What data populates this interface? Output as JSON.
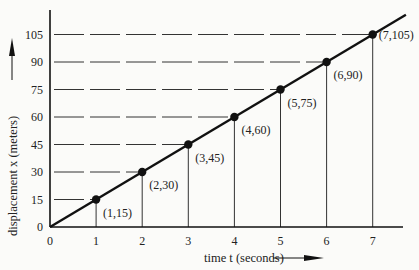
{
  "chart_data": {
    "type": "line",
    "title": "",
    "xlabel": "time t (seconds)",
    "ylabel": "displacement x (meters)",
    "x": [
      1,
      2,
      3,
      4,
      5,
      6,
      7
    ],
    "series": [
      {
        "name": "displacement",
        "values": [
          15,
          30,
          45,
          60,
          75,
          90,
          105
        ]
      }
    ],
    "point_labels": [
      "(1,15)",
      "(2,30)",
      "(3,45)",
      "(4,60)",
      "(5,75)",
      "(6,90)",
      "(7,105)"
    ],
    "x_ticks": [
      "0",
      "1",
      "2",
      "3",
      "4",
      "5",
      "6",
      "7"
    ],
    "y_ticks": [
      "0",
      "15",
      "30",
      "45",
      "60",
      "75",
      "90",
      "105"
    ],
    "xlim": [
      0,
      7.8
    ],
    "ylim": [
      0,
      118
    ],
    "grid": "dashed horizontal guides and solid vertical drop lines at each data point",
    "legend": "none",
    "colors": {
      "line": "#111111",
      "points": "#111111",
      "guides": "#333333",
      "background": "#fbfbf9"
    }
  },
  "labels": {
    "xlabel": "time t (seconds)",
    "ylabel": "displacement x (meters)"
  }
}
